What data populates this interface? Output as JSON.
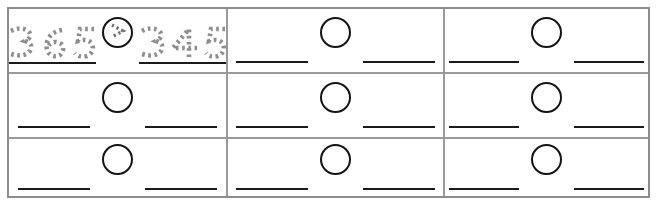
{
  "worksheet": {
    "title": "Compare numbers worksheet grid",
    "rows": 3,
    "columns": 3,
    "colors": {
      "outer_border": "#8d8d8d",
      "inner_border": "#9a9a9a",
      "ink": "#141414",
      "trace_gray": "#8e8e8e",
      "background": "#ffffff"
    },
    "cells": [
      {
        "id": "cell-1",
        "filled": true,
        "left_number": "365",
        "operator": ">",
        "operator_name": "greater-than",
        "right_number": "345",
        "style": "dotted-trace"
      },
      {
        "id": "cell-2",
        "filled": false,
        "left_number": "",
        "operator": "",
        "right_number": ""
      },
      {
        "id": "cell-3",
        "filled": false,
        "left_number": "",
        "operator": "",
        "right_number": ""
      },
      {
        "id": "cell-4",
        "filled": false,
        "left_number": "",
        "operator": "",
        "right_number": ""
      },
      {
        "id": "cell-5",
        "filled": false,
        "left_number": "",
        "operator": "",
        "right_number": ""
      },
      {
        "id": "cell-6",
        "filled": false,
        "left_number": "",
        "operator": "",
        "right_number": ""
      },
      {
        "id": "cell-7",
        "filled": false,
        "left_number": "",
        "operator": "",
        "right_number": ""
      },
      {
        "id": "cell-8",
        "filled": false,
        "left_number": "",
        "operator": "",
        "right_number": ""
      },
      {
        "id": "cell-9",
        "filled": false,
        "left_number": "",
        "operator": "",
        "right_number": ""
      }
    ]
  }
}
